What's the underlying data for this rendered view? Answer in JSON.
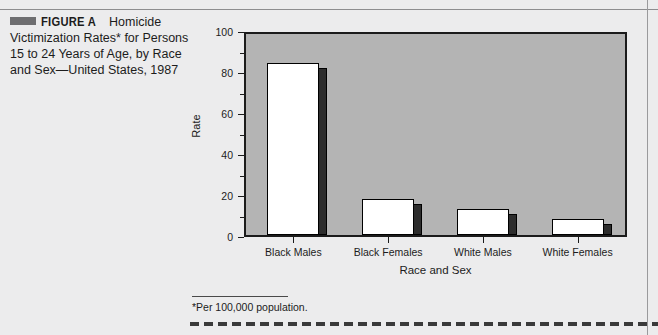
{
  "figure": {
    "swatch_color": "#6e6e70",
    "label": "FIGURE A",
    "caption_first_segment": "Homicide",
    "caption_rest": "Victimization Rates* for Persons 15 to 24 Years of Age, by Race and Sex—United States, 1987"
  },
  "footnote": {
    "text": "*Per 100,000 population."
  },
  "chart_data": {
    "type": "bar",
    "title": "",
    "xlabel": "Race and Sex",
    "ylabel": "Rate",
    "categories": [
      "Black Males",
      "Black Females",
      "White Males",
      "White Females"
    ],
    "values": [
      85.6,
      18.0,
      13.0,
      8.0
    ],
    "ylim": [
      0,
      100
    ],
    "yticks": [
      0,
      20,
      40,
      60,
      80,
      100
    ],
    "ytick_labels": [
      "0",
      "20",
      "40",
      "60",
      "80",
      "100"
    ],
    "minor_yticks": [
      10,
      30,
      50,
      70,
      90
    ],
    "grid": false,
    "legend": "none",
    "plot_background": "#b4b4b4",
    "bar_face_color": "#ffffff",
    "bar_side_color": "#2d2d2d",
    "bar_edge_color": "#000000"
  }
}
